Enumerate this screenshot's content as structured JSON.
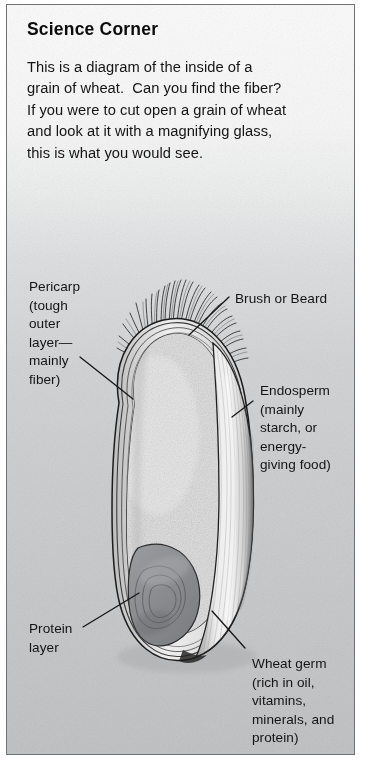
{
  "page": {
    "title": "Science Corner",
    "intro": "This is a diagram of the inside of a\ngrain of wheat.  Can you find the fiber?\nIf you were to cut open a grain of wheat\nand look at it with a magnifying glass,\nthis is what you would see."
  },
  "diagram": {
    "labels": {
      "pericarp": "Pericarp\n(tough\nouter\nlayer—\nmainly\nfiber)",
      "brush": "Brush or Beard",
      "endosperm": "Endosperm\n(mainly\nstarch, or\nenergy-\ngiving food)",
      "protein": "Protein\nlayer",
      "germ": "Wheat germ\n(rich in oil,\nvitamins,\nminerals, and\nprotein)"
    }
  },
  "colors": {
    "paper_top": "#fbfbfb",
    "paper_bottom": "#c0c1c2",
    "frame_border": "#6f7174",
    "ink": "#141414",
    "endosperm_fill": "#dcdcdc",
    "germ_fill": "#8f9094",
    "lobe_light": "#eeeeee",
    "pericarp_line": "#2b2b2b"
  }
}
